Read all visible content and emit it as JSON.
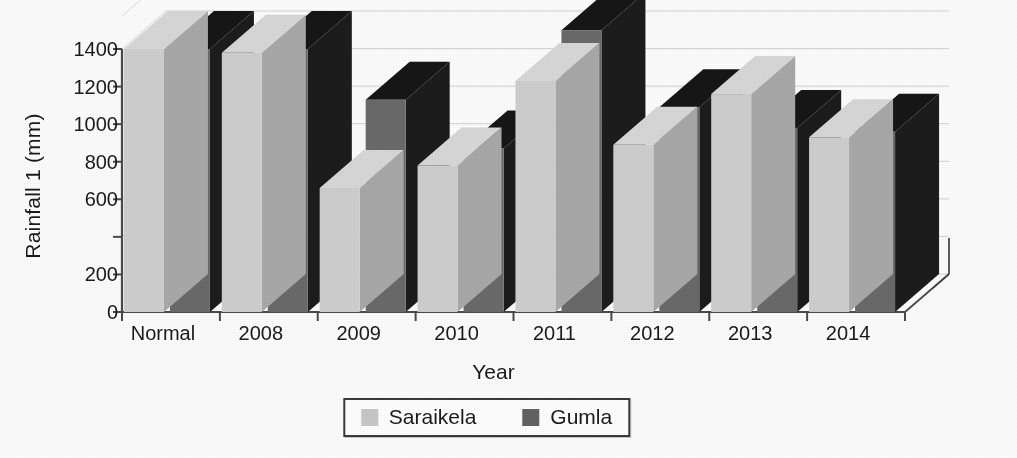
{
  "chart_data": {
    "type": "bar",
    "title": "",
    "xlabel": "Year",
    "ylabel": "Rainfall 1 (mm)",
    "categories": [
      "Normal",
      "2008",
      "2009",
      "2010",
      "2011",
      "2012",
      "2013",
      "2014"
    ],
    "series": [
      {
        "name": "Saraikela",
        "color": "#c8c8c8",
        "values": [
          1400,
          1380,
          660,
          780,
          1230,
          890,
          1160,
          930
        ]
      },
      {
        "name": "Gumla",
        "color": "#636363",
        "values": [
          1400,
          1400,
          1130,
          870,
          1500,
          1090,
          980,
          960
        ]
      }
    ],
    "ylim": [
      0,
      1500
    ],
    "yticks": [
      0,
      200,
      400,
      600,
      800,
      1000,
      1200,
      1400
    ],
    "ytick_labels": [
      "0",
      "200",
      "",
      "600",
      "800",
      "1000",
      "1200",
      "1400"
    ],
    "grid": true,
    "legend_position": "bottom",
    "three_d": true
  },
  "legend": {
    "items": [
      {
        "label": "Saraikela",
        "color": "#c8c8c8"
      },
      {
        "label": "Gumla",
        "color": "#636363"
      }
    ]
  },
  "colors": {
    "saraikela_front": "#cfcfcf",
    "saraikela_side": "#a9a9a9",
    "saraikela_top": "#d8d8d8",
    "gumla_front": "#6a6a6a",
    "gumla_side": "#1c1c1c",
    "gumla_top": "#161616",
    "axis": "#4a4a4a",
    "grid": "#d2d2d2",
    "text": "#1a1a1a"
  }
}
